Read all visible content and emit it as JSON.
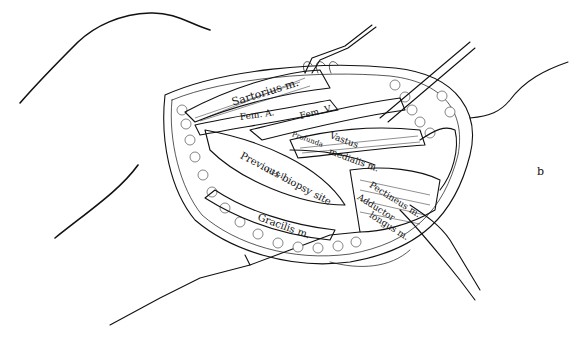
{
  "figure": {
    "ink_color": "#111111",
    "background_color": "#ffffff"
  },
  "labels": {
    "sartorius": "Sartorius m.",
    "fem_artery": "Fem. A.",
    "fem_vein": "Fem. V.",
    "profunda": "Profunda",
    "vastus": "Vastus",
    "medialis": "medialis m.",
    "biopsy": "Previous biopsy site",
    "biopsy_marks": "-I-I-I-I-",
    "pectineus": "Pectineus m.",
    "adductor": "Adductor",
    "longus": "longus m.",
    "gracilis": "Gracilis m.",
    "panel_letter": "b"
  }
}
